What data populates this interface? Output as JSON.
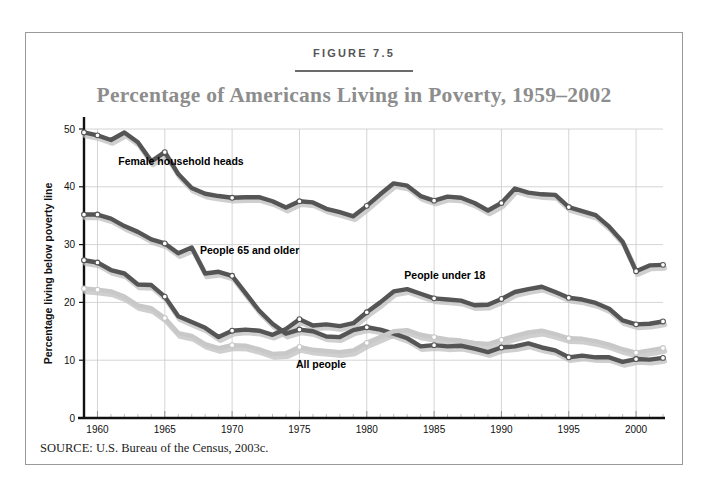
{
  "figure": {
    "number_label": "FIGURE 7.5",
    "title": "Percentage of Americans Living in Poverty, 1959–2002",
    "source": "SOURCE: U.S. Bureau of the Census, 2003c."
  },
  "colors": {
    "title": "#8d8d8d",
    "dark_line": "#555555",
    "light_line": "#c8c8c8",
    "shadow": "#bfbfbf",
    "grid": "#c9c9c9",
    "axis": "#111111",
    "frame": "#9a9a9a",
    "marker_fill": "#ffffff"
  },
  "chart_data": {
    "type": "line",
    "title": "Percentage of Americans Living in Poverty, 1959–2002",
    "xlabel": "",
    "ylabel": "Percentage living below poverty line",
    "xlim": [
      1959,
      2002
    ],
    "ylim": [
      0,
      50
    ],
    "ytick_values": [
      0,
      10,
      20,
      30,
      40,
      50
    ],
    "ytick_labels": [
      "0",
      "10",
      "20",
      "30",
      "40",
      "50"
    ],
    "xtick_values": [
      1960,
      1965,
      1970,
      1975,
      1980,
      1985,
      1990,
      1995,
      2000
    ],
    "xtick_labels": [
      "1960",
      "1965",
      "1970",
      "1975",
      "1980",
      "1985",
      "1990",
      "1995",
      "2000"
    ],
    "minor_xticks_every": 1,
    "grid": "both-major",
    "legend": "inline-annotations",
    "marker_years": [
      1959,
      1960,
      1965,
      1970,
      1975,
      1980,
      1985,
      1990,
      1995,
      2000,
      2002
    ],
    "x": [
      1959,
      1960,
      1961,
      1962,
      1963,
      1964,
      1965,
      1966,
      1967,
      1968,
      1969,
      1970,
      1971,
      1972,
      1973,
      1974,
      1975,
      1976,
      1977,
      1978,
      1979,
      1980,
      1981,
      1982,
      1983,
      1984,
      1985,
      1986,
      1987,
      1988,
      1989,
      1990,
      1991,
      1992,
      1993,
      1994,
      1995,
      1996,
      1997,
      1998,
      1999,
      2000,
      2001,
      2002
    ],
    "series": [
      {
        "name": "Female household heads",
        "style": "dark",
        "label_x": 1966.2,
        "label_y": 43.8,
        "values": [
          49.4,
          48.9,
          48.1,
          49.4,
          47.7,
          44.4,
          46.0,
          42.2,
          39.8,
          38.8,
          38.4,
          38.1,
          38.2,
          38.2,
          37.5,
          36.4,
          37.5,
          37.3,
          36.2,
          35.6,
          34.9,
          36.7,
          38.7,
          40.6,
          40.2,
          38.4,
          37.6,
          38.3,
          38.1,
          37.2,
          35.9,
          37.2,
          39.7,
          39.0,
          38.7,
          38.6,
          36.5,
          35.8,
          35.1,
          33.1,
          30.5,
          25.4,
          26.4,
          26.5
        ]
      },
      {
        "name": "People 65 and older",
        "style": "dark",
        "label_x": 1971.3,
        "label_y": 28.4,
        "values": [
          35.2,
          35.2,
          34.5,
          33.2,
          32.2,
          30.9,
          30.2,
          28.5,
          29.5,
          25.0,
          25.3,
          24.6,
          21.6,
          18.6,
          16.3,
          14.6,
          15.3,
          15.0,
          14.1,
          14.0,
          15.2,
          15.7,
          15.3,
          14.6,
          13.8,
          12.4,
          12.6,
          12.4,
          12.5,
          12.0,
          11.4,
          12.2,
          12.4,
          12.9,
          12.2,
          11.7,
          10.5,
          10.8,
          10.5,
          10.5,
          9.7,
          10.2,
          10.1,
          10.4
        ]
      },
      {
        "name": "People under 18",
        "style": "dark",
        "label_x": 1985.8,
        "label_y": 24.0,
        "values": [
          27.3,
          26.9,
          25.6,
          25.0,
          23.1,
          23.0,
          21.0,
          17.6,
          16.6,
          15.6,
          14.0,
          15.1,
          15.3,
          15.1,
          14.4,
          15.4,
          17.1,
          16.0,
          16.2,
          15.9,
          16.4,
          18.3,
          20.0,
          21.9,
          22.3,
          21.5,
          20.7,
          20.5,
          20.3,
          19.5,
          19.6,
          20.6,
          21.8,
          22.3,
          22.7,
          21.8,
          20.8,
          20.5,
          19.9,
          18.9,
          16.9,
          16.2,
          16.3,
          16.7
        ]
      },
      {
        "name": "All people",
        "style": "light",
        "label_x": 1976.6,
        "label_y": 8.6,
        "values": [
          22.4,
          22.2,
          21.9,
          21.0,
          19.5,
          19.0,
          17.3,
          14.7,
          14.2,
          12.8,
          12.1,
          12.6,
          12.5,
          11.9,
          11.1,
          11.2,
          12.3,
          11.8,
          11.6,
          11.4,
          11.7,
          13.0,
          14.0,
          15.0,
          15.2,
          14.4,
          14.0,
          13.6,
          13.4,
          13.0,
          12.8,
          13.5,
          14.2,
          14.8,
          15.1,
          14.5,
          13.8,
          13.7,
          13.3,
          12.7,
          11.9,
          11.3,
          11.7,
          12.1
        ]
      }
    ]
  }
}
